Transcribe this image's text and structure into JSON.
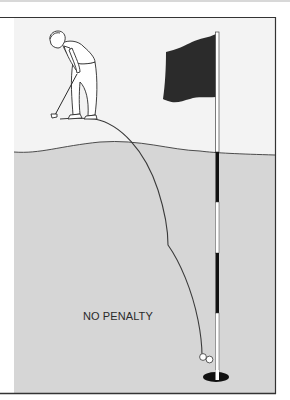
{
  "illustration": {
    "caption": "NO PENALTY",
    "colors": {
      "sky": "#f3f3f3",
      "green": "#d6d6d6",
      "line": "#3a3a3a",
      "flag": "#2b2b2b",
      "hole": "#111111",
      "pole_dark": "#111111",
      "pole_light": "#ffffff",
      "ball": "#ffffff"
    },
    "elements": {
      "golfer": "golfer-putting",
      "flagstick": "flag-with-striped-pole",
      "ball_path": "curved-putt-trajectory",
      "balls": 2,
      "hole": "cup"
    }
  }
}
